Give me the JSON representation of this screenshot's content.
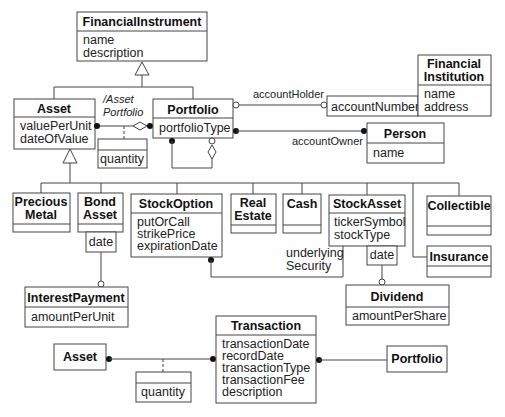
{
  "diagram": {
    "type": "UML class diagram",
    "classes": {
      "financial_instrument": {
        "name": "FinancialInstrument",
        "attributes": [
          "name",
          "description"
        ]
      },
      "asset": {
        "name": "Asset",
        "attributes": [
          "valuePerUnit",
          "dateOfValue"
        ]
      },
      "portfolio": {
        "name": "Portfolio",
        "attributes": [
          "portfolioType"
        ]
      },
      "financial_institution": {
        "name_lines": [
          "Financial",
          "Institution"
        ],
        "attributes": [
          "name",
          "address"
        ]
      },
      "person": {
        "name": "Person",
        "attributes": [
          "name"
        ]
      },
      "precious_metal": {
        "name_lines": [
          "Precious",
          "Metal"
        ]
      },
      "bond_asset": {
        "name_lines": [
          "Bond",
          "Asset"
        ]
      },
      "stock_option": {
        "name": "StockOption",
        "attributes": [
          "putOrCall",
          "strikePrice",
          "expirationDate"
        ]
      },
      "real_estate": {
        "name_lines": [
          "Real",
          "Estate"
        ]
      },
      "cash": {
        "name": "Cash"
      },
      "stock_asset": {
        "name": "StockAsset",
        "attributes": [
          "tickerSymbol",
          "stockType"
        ]
      },
      "collectible": {
        "name": "Collectible"
      },
      "insurance": {
        "name": "Insurance"
      },
      "interest_payment": {
        "name": "InterestPayment",
        "attributes": [
          "amountPerUnit"
        ]
      },
      "dividend": {
        "name": "Dividend",
        "attributes": [
          "amountPerShare"
        ]
      },
      "transaction": {
        "name": "Transaction",
        "attributes": [
          "transactionDate",
          "recordDate",
          "transactionType",
          "transactionFee",
          "description"
        ]
      },
      "asset_ref": {
        "name": "Asset"
      },
      "portfolio_ref": {
        "name": "Portfolio"
      }
    },
    "link_attributes": {
      "asset_portfolio_quantity": "quantity",
      "transaction_asset_quantity": "quantity"
    },
    "qualifiers": {
      "account_number": "accountNumber",
      "bond_date": "date",
      "stock_date": "date"
    },
    "roles": {
      "derived_asset_portfolio": [
        "/Asset",
        "Portfolio"
      ],
      "account_holder": "accountHolder",
      "account_owner": "accountOwner",
      "underlying_security": [
        "underlying",
        "Security"
      ]
    }
  }
}
